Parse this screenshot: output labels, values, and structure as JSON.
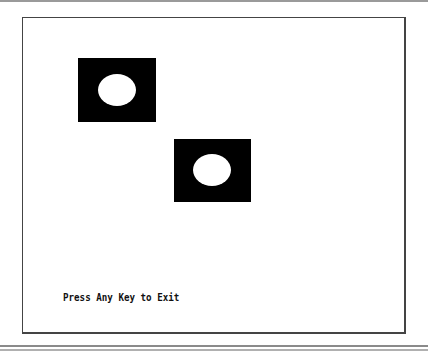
{
  "screen": {
    "message": "Press Any Key to Exit",
    "background_color": "#ffffff",
    "sprite_color": "#000000",
    "hole_color": "#ffffff"
  },
  "sprites": [
    {
      "name": "sprite-1",
      "x": 78,
      "y": 58,
      "w": 78,
      "h": 64,
      "hole": {
        "cx": 117,
        "cy": 90,
        "rx": 19,
        "ry": 16
      }
    },
    {
      "name": "sprite-2",
      "x": 174,
      "y": 139,
      "w": 77,
      "h": 63,
      "hole": {
        "cx": 212,
        "cy": 170,
        "rx": 19,
        "ry": 16
      }
    }
  ]
}
